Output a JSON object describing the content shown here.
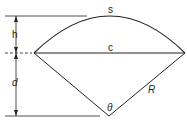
{
  "diagram": {
    "labels": {
      "arc": "s",
      "chord": "c",
      "height": "h",
      "distance": "d",
      "radius": "R",
      "angle": "θ"
    },
    "colors": {
      "stroke": "#222222",
      "background": "#ffffff"
    }
  }
}
